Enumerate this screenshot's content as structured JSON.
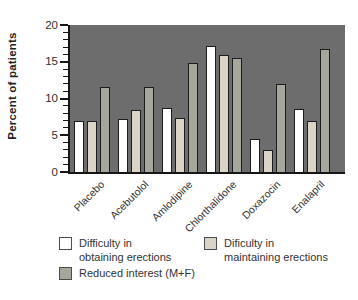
{
  "chart_data": {
    "type": "bar",
    "title": "",
    "ylabel": "Percent of patients",
    "xlabel": "",
    "ylim": [
      0,
      20
    ],
    "yticks": [
      0,
      5,
      10,
      15,
      20
    ],
    "minor_tick_step": 1,
    "grid": false,
    "plot_background": "#6d6d6d",
    "bar_border_color": "#1c1c1c",
    "legend_position": "bottom",
    "categories": [
      "Placebo",
      "Acebutolol",
      "Amlodipine",
      "Chlorthalidone",
      "Doxazocin",
      "Enalapril"
    ],
    "series": [
      {
        "name": "Difficulty in obtaining erections",
        "color": "#ffffff",
        "values": [
          7.0,
          7.2,
          8.7,
          17.1,
          4.5,
          8.6
        ]
      },
      {
        "name": "Dificulty in maintaining erections",
        "color": "#d9d4c6",
        "values": [
          7.0,
          8.5,
          7.3,
          15.9,
          3.0,
          7.0
        ]
      },
      {
        "name": "Reduced interest (M+F)",
        "color": "#a5a79d",
        "values": [
          11.5,
          11.5,
          14.8,
          15.5,
          12.0,
          16.7
        ]
      }
    ]
  },
  "legend": {
    "items": [
      {
        "line1": "Difficulty in",
        "line2": "obtaining erections"
      },
      {
        "line1": "Dificulty in",
        "line2": "maintaining erections"
      },
      {
        "line1": "Reduced interest (M+F)",
        "line2": ""
      }
    ]
  }
}
